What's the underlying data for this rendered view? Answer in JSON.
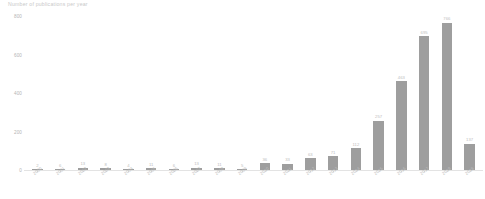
{
  "chart_data": {
    "type": "bar",
    "title": "Number of publications per year",
    "xlabel": "",
    "ylabel": "",
    "categories": [
      "2000",
      "2001",
      "2002",
      "2003",
      "2004",
      "2005",
      "2006",
      "2007",
      "2008",
      "2009",
      "2010",
      "2011",
      "2012",
      "2013",
      "2014",
      "2015",
      "2016",
      "2017",
      "2018",
      "2019"
    ],
    "values": [
      2,
      6,
      13,
      8,
      4,
      11,
      6,
      13,
      11,
      5,
      36,
      33,
      63,
      71,
      112,
      257,
      463,
      695,
      766,
      137
    ],
    "ylim": [
      0,
      800
    ],
    "y_ticks": [
      "0",
      "200",
      "400",
      "600",
      "800"
    ],
    "y_tick_values": [
      0,
      200,
      400,
      600,
      800
    ],
    "grid": false,
    "legend": "none",
    "bar_color": "#9e9e9e",
    "axis_color": "#e3e3e3",
    "label_color": "#bdbdbd"
  }
}
